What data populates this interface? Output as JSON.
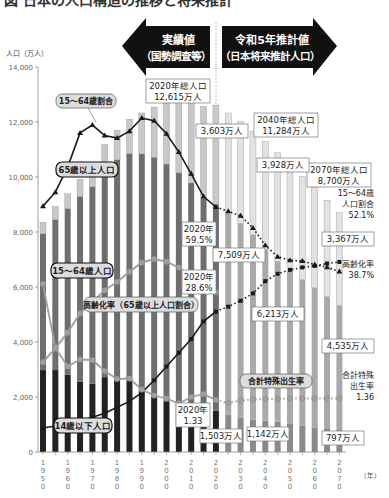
{
  "title_partial": "図 日本の人口構造の推移と将来推計",
  "arrows": {
    "left": {
      "line1": "実績値",
      "line2": "（国勢調査等）"
    },
    "right": {
      "line1": "令和5年推計値",
      "line2": "（日本将来推計人口）"
    }
  },
  "axis": {
    "y_unit": "人口（万人）",
    "y_ticks": [
      "0",
      "2,000",
      "4,000",
      "6,000",
      "8,000",
      "10,000",
      "12,000",
      "14,000"
    ],
    "x_unit": "（年）",
    "x_ticks": [
      "1950",
      "1960",
      "1970",
      "1980",
      "1990",
      "2000",
      "2010",
      "2020",
      "2030",
      "2040",
      "2050",
      "2060",
      "2070"
    ]
  },
  "labels": {
    "ratio1564": "15〜64歳割合",
    "pop65": "65歳以上人口",
    "pop1564": "15〜64歳人口",
    "aging_rate": "高齢化率（65歳以上人口割合）",
    "pop014": "14歳以下人口",
    "tfr": "合計特殊出生率",
    "total2020_l1": "2020年総人口",
    "total2020_l2": "12,615万人",
    "total2040_l1": "2040年総人口",
    "total2040_l2": "11,284万人",
    "total2070_l1": "2070年総人口",
    "total2070_l2": "8,700万人",
    "p65_2020": "3,603万人",
    "p65_2040": "3,928万人",
    "p65_2070": "3,367万人",
    "ratio_2020_l1": "2020年",
    "ratio_2020_l2": "59.5%",
    "aging_2020_l1": "2020年",
    "aging_2020_l2": "28.6%",
    "p1564_2020": "7,509万人",
    "p1564_2040": "6,213万人",
    "p1564_2070": "4,535万人",
    "ratio_2070_l1": "15〜64歳",
    "ratio_2070_l2": "人口割合",
    "ratio_2070_l3": "52.1%",
    "aging_2070_l1": "高齢化率",
    "aging_2070_l2": "38.7%",
    "tfr_2020_l1": "2020年",
    "tfr_2020_l2": "1.33",
    "tfr_2070_l1": "合計特殊",
    "tfr_2070_l2": "出生率",
    "tfr_2070_l3": "1.36",
    "p014_2020": "1,503万人",
    "p014_2040": "1,142万人",
    "p014_2070": "797万人"
  },
  "colors": {
    "pop014_actual": "#222222",
    "pop1564_actual": "#6e6e6e",
    "pop65_actual": "#c8c8c8",
    "pop014_proj": "#8a8a8a",
    "pop1564_proj": "#a9a9a9",
    "pop65_proj": "#e2e2e2",
    "arrow": "#111111",
    "line_dark": "#1a1a1a",
    "line_grey": "#a0a0a0"
  },
  "chart_data": {
    "type": "bar",
    "title": "日本の人口構造の推移と将来推計",
    "xlabel": "（年）",
    "ylabel": "人口（万人）",
    "ylim": [
      0,
      14000
    ],
    "grid": false,
    "stacked": true,
    "categories": [
      "1950",
      "1955",
      "1960",
      "1965",
      "1970",
      "1975",
      "1980",
      "1985",
      "1990",
      "1995",
      "2000",
      "2005",
      "2010",
      "2015",
      "2020",
      "2025",
      "2030",
      "2035",
      "2040",
      "2045",
      "2050",
      "2055",
      "2060",
      "2065",
      "2070"
    ],
    "projection_from": "2025",
    "series": [
      {
        "name": "14歳以下人口",
        "values": [
          2979,
          2980,
          2807,
          2553,
          2482,
          2722,
          2751,
          2603,
          2249,
          2001,
          1847,
          1752,
          1680,
          1589,
          1503,
          1363,
          1240,
          1169,
          1142,
          1103,
          1041,
          966,
          893,
          836,
          797
        ]
      },
      {
        "name": "15〜64歳人口",
        "values": [
          4966,
          5473,
          6047,
          6744,
          7157,
          7581,
          7883,
          8251,
          8590,
          8716,
          8622,
          8409,
          8103,
          7629,
          7509,
          7310,
          7076,
          6722,
          6213,
          5832,
          5540,
          5307,
          5078,
          4809,
          4535
        ]
      },
      {
        "name": "65歳以上人口",
        "values": [
          411,
          475,
          540,
          624,
          739,
          887,
          1065,
          1247,
          1489,
          1826,
          2204,
          2576,
          2925,
          3347,
          3603,
          3653,
          3696,
          3773,
          3928,
          3945,
          3888,
          3744,
          3644,
          3508,
          3367
        ]
      }
    ],
    "line_series": [
      {
        "name": "15〜64歳割合",
        "unit": "%",
        "values": [
          59.6,
          61.2,
          64.1,
          68.0,
          68.9,
          67.7,
          67.4,
          68.2,
          69.7,
          69.4,
          67.9,
          65.8,
          63.3,
          60.7,
          59.5,
          59.0,
          58.5,
          57.1,
          55.1,
          53.8,
          53.4,
          53.3,
          52.9,
          52.6,
          52.1
        ]
      },
      {
        "name": "高齢化率（65歳以上人口割合）",
        "unit": "%",
        "values": [
          4.9,
          5.3,
          5.7,
          6.3,
          7.1,
          7.9,
          9.1,
          10.3,
          12.1,
          14.6,
          17.4,
          20.2,
          23.0,
          26.6,
          28.6,
          29.6,
          30.8,
          32.3,
          34.8,
          36.3,
          37.1,
          37.6,
          37.9,
          38.4,
          38.7
        ]
      },
      {
        "name": "合計特殊出生率",
        "unit": "",
        "values": [
          3.65,
          2.37,
          2.0,
          2.14,
          2.13,
          1.91,
          1.75,
          1.76,
          1.54,
          1.42,
          1.36,
          1.26,
          1.39,
          1.45,
          1.33,
          1.27,
          1.32,
          1.34,
          1.35,
          1.35,
          1.36,
          1.36,
          1.36,
          1.36,
          1.36
        ]
      }
    ],
    "annotations": [
      "2020年総人口 12,615万人",
      "2040年総人口 11,284万人",
      "2070年総人口 8,700万人",
      "65歳以上 2020: 3,603万人",
      "2040: 3,928万人",
      "2070: 3,367万人",
      "15〜64歳 2020: 7,509万人",
      "2040: 6,213万人",
      "2070: 4,535万人",
      "14歳以下 2020: 1,503万人",
      "2040: 1,142万人",
      "2070: 797万人",
      "15〜64歳割合 2020: 59.5%",
      "2070: 52.1%",
      "高齢化率 2020: 28.6%",
      "2070: 38.7%",
      "合計特殊出生率 2020: 1.33",
      "2070: 1.36"
    ]
  }
}
